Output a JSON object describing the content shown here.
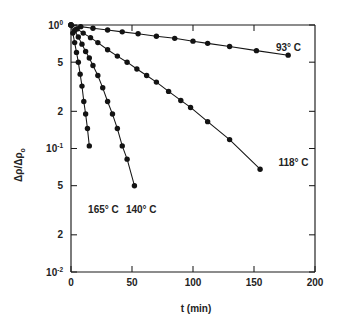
{
  "figure": {
    "background_color": "#ffffff",
    "ink_color": "#151515"
  },
  "chart_data": {
    "type": "line",
    "title": "",
    "subtitle": "",
    "xlabel": "t (min)",
    "ylabel": "Δρ/Δρ₀",
    "ylabel_parts": {
      "numerator": "Δρ/Δρ",
      "subscript": "o"
    },
    "xlim": [
      0,
      200
    ],
    "ylim": [
      0.01,
      1
    ],
    "yscale": "log",
    "xscale": "linear",
    "grid": false,
    "legend_position": "inline-right-of-curves",
    "x_ticks": [
      0,
      50,
      100,
      150,
      200
    ],
    "x_tick_labels": [
      "0",
      "50",
      "100",
      "150",
      "200"
    ],
    "y_ticks": [
      1,
      0.5,
      0.2,
      0.1,
      0.05,
      0.02,
      0.01
    ],
    "y_tick_labels": [
      "10⁰",
      "5",
      "2",
      "10⁻¹",
      "5",
      "2",
      "10⁻²"
    ],
    "y_tick_labels_plain": [
      "10",
      "5",
      "2",
      "10",
      "5",
      "2",
      "10"
    ],
    "y_tick_exponents": [
      "0",
      "",
      "",
      "-1",
      "",
      "",
      "-2"
    ],
    "series": [
      {
        "name": "93° C",
        "label": "93° C",
        "label_x": 168,
        "label_y": 0.62,
        "x": [
          0,
          8,
          18,
          30,
          42,
          55,
          70,
          85,
          100,
          112,
          130,
          152,
          178
        ],
        "y": [
          1.0,
          0.97,
          0.94,
          0.91,
          0.88,
          0.85,
          0.81,
          0.78,
          0.74,
          0.71,
          0.67,
          0.62,
          0.57
        ],
        "marker": "filled-circle"
      },
      {
        "name": "118° C",
        "label": "118° C",
        "label_x": 170,
        "label_y": 0.072,
        "x": [
          0,
          5,
          10,
          16,
          22,
          30,
          38,
          46,
          54,
          62,
          70,
          80,
          90,
          98,
          112,
          130,
          155
        ],
        "y": [
          1.0,
          0.93,
          0.86,
          0.79,
          0.72,
          0.63,
          0.56,
          0.5,
          0.44,
          0.39,
          0.345,
          0.29,
          0.245,
          0.215,
          0.165,
          0.118,
          0.068
        ],
        "marker": "filled-circle"
      },
      {
        "name": "140° C",
        "label": "140° C",
        "label_x": 45,
        "label_y": 0.03,
        "x": [
          0,
          3,
          6,
          9,
          12,
          15,
          18,
          22,
          26,
          30,
          34,
          38,
          42,
          46,
          52
        ],
        "y": [
          1.0,
          0.9,
          0.8,
          0.7,
          0.61,
          0.54,
          0.47,
          0.39,
          0.31,
          0.24,
          0.19,
          0.145,
          0.105,
          0.082,
          0.05
        ],
        "marker": "filled-circle"
      },
      {
        "name": "165° C",
        "label": "165° C",
        "label_x": 14,
        "label_y": 0.03,
        "x": [
          0,
          1.5,
          3,
          4.5,
          6,
          7.5,
          9,
          10.5,
          12,
          13.5,
          15
        ],
        "y": [
          1.0,
          0.86,
          0.72,
          0.6,
          0.5,
          0.4,
          0.32,
          0.24,
          0.19,
          0.145,
          0.105
        ],
        "marker": "filled-circle"
      }
    ]
  }
}
